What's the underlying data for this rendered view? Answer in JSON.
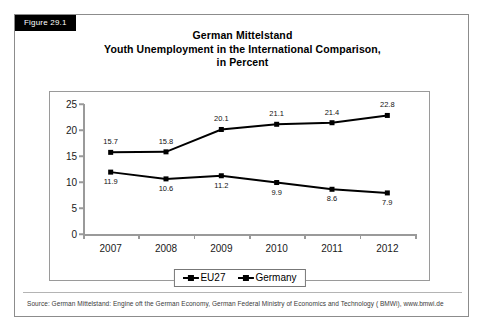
{
  "figure": {
    "tag": "Figure 29.1",
    "title_lines": [
      "German Mittelstand",
      "Youth Unemployment in the International Comparison,",
      "in Percent"
    ],
    "source": "Source: German Mittelstand: Engine oft the German Economy, German Federal Ministry of Economics and Technology ( BMWi), www.bmwi.de"
  },
  "chart_data": {
    "type": "line",
    "title": "German Mittelstand Youth Unemployment in the International Comparison, in Percent",
    "xlabel": "",
    "ylabel": "",
    "categories": [
      "2007",
      "2008",
      "2009",
      "2010",
      "2011",
      "2012"
    ],
    "series": [
      {
        "name": "EU27",
        "values": [
          15.7,
          15.8,
          20.1,
          21.1,
          21.4,
          22.8
        ],
        "marker": "square",
        "color": "#000000",
        "label_position": "above"
      },
      {
        "name": "Germany",
        "values": [
          11.9,
          10.6,
          11.2,
          9.9,
          8.6,
          7.9
        ],
        "marker": "square",
        "color": "#000000",
        "label_position": "below"
      }
    ],
    "ylim": [
      0,
      25
    ],
    "yticks": [
      0,
      5,
      10,
      15,
      20,
      25
    ],
    "ytick_labels": [
      "0",
      "5",
      "10",
      "15",
      "20",
      "25"
    ],
    "grid": false,
    "legend_position": "bottom",
    "data_labels": true
  }
}
